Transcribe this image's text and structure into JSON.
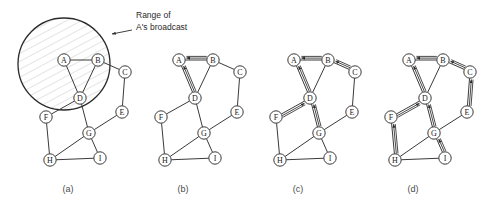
{
  "figure": {
    "background_color": "#ffffff",
    "line_color": "#3a3a3a",
    "node_fill": "#ffffff",
    "annotation": {
      "line1": "Range of",
      "line2": "A's broadcast"
    },
    "panels": [
      {
        "id": "a",
        "caption": "(a)",
        "offset_x": 0,
        "has_range_circle": true,
        "arrows": []
      },
      {
        "id": "b",
        "caption": "(b)",
        "offset_x": 115,
        "has_range_circle": false,
        "arrows": [
          "B->A",
          "D->A"
        ]
      },
      {
        "id": "c",
        "caption": "(c)",
        "offset_x": 230,
        "has_range_circle": false,
        "arrows": [
          "B->A",
          "D->A",
          "C->B",
          "F->D",
          "G->D"
        ]
      },
      {
        "id": "d",
        "caption": "(d)",
        "offset_x": 345,
        "has_range_circle": false,
        "arrows": [
          "B->A",
          "D->A",
          "C->B",
          "F->D",
          "G->D",
          "E->C",
          "H->F",
          "I->G"
        ]
      }
    ],
    "nodes": [
      {
        "id": "A",
        "label": "A",
        "x": 64,
        "y": 60
      },
      {
        "id": "B",
        "label": "B",
        "x": 98,
        "y": 60
      },
      {
        "id": "C",
        "label": "C",
        "x": 125,
        "y": 72
      },
      {
        "id": "D",
        "label": "D",
        "x": 80,
        "y": 98
      },
      {
        "id": "E",
        "label": "E",
        "x": 122,
        "y": 112
      },
      {
        "id": "F",
        "label": "F",
        "x": 46,
        "y": 117
      },
      {
        "id": "G",
        "label": "G",
        "x": 89,
        "y": 133
      },
      {
        "id": "H",
        "label": "H",
        "x": 50,
        "y": 160
      },
      {
        "id": "I",
        "label": "I",
        "x": 100,
        "y": 158
      }
    ],
    "edges": [
      [
        "A",
        "B"
      ],
      [
        "A",
        "D"
      ],
      [
        "B",
        "D"
      ],
      [
        "B",
        "C"
      ],
      [
        "C",
        "E"
      ],
      [
        "D",
        "F"
      ],
      [
        "D",
        "G"
      ],
      [
        "E",
        "G"
      ],
      [
        "F",
        "H"
      ],
      [
        "G",
        "H"
      ],
      [
        "G",
        "I"
      ],
      [
        "H",
        "I"
      ]
    ],
    "range_circle": {
      "cx": 64,
      "cy": 64,
      "r": 46
    },
    "caption_y": 192
  }
}
